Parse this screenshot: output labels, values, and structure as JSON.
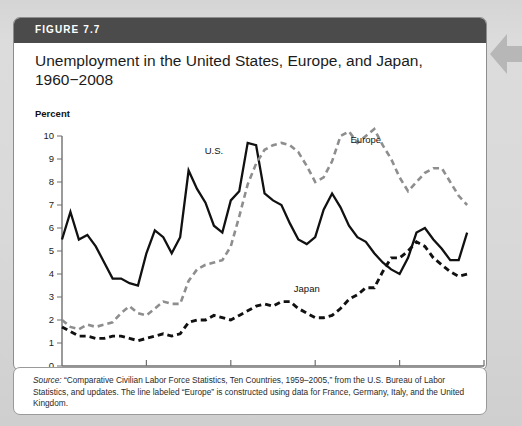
{
  "figure": {
    "number_label": "FIGURE 7.7",
    "title_line1": "Unemployment in the United States, Europe, and Japan,",
    "title_line2": "1960−2008",
    "percent_label": "Percent",
    "source_prefix": "Source:",
    "source_body": " “Comparative Civilian Labor Force Statistics, Ten Countries, 1959–2005,” from the U.S. Bureau of Labor Statistics, and updates. The line labeled “Europe” is constructed using data for France, Germany, Italy, and the United Kingdom."
  },
  "colors": {
    "header_bar": "#4b4b4b",
    "card_background": "#ffffff",
    "page_background": "#d8d8d8",
    "us_line": "#111111",
    "japan_line": "#111111",
    "europe_line": "#8e8e8e",
    "axis": "#6f6f6f",
    "edge_arrow": "#b4b4b4"
  },
  "chart_data": {
    "type": "line",
    "title": "Unemployment in the United States, Europe, and Japan, 1960−2008",
    "xlabel": "Year",
    "ylabel": "Percent",
    "xlim": [
      1960,
      2010
    ],
    "ylim": [
      0,
      10
    ],
    "grid": false,
    "legend_position": "inline-annotations",
    "x_ticks": [
      "1960",
      "1970",
      "1980",
      "1990",
      "2000",
      "2010"
    ],
    "x_tick_values": [
      1960,
      1970,
      1980,
      1990,
      2000,
      2010
    ],
    "y_ticks": [
      "0",
      "1",
      "2",
      "3",
      "4",
      "5",
      "6",
      "7",
      "8",
      "9",
      "10"
    ],
    "y_tick_values": [
      0,
      1,
      2,
      3,
      4,
      5,
      6,
      7,
      8,
      9,
      10
    ],
    "x": [
      1960,
      1961,
      1962,
      1963,
      1964,
      1965,
      1966,
      1967,
      1968,
      1969,
      1970,
      1971,
      1972,
      1973,
      1974,
      1975,
      1976,
      1977,
      1978,
      1979,
      1980,
      1981,
      1982,
      1983,
      1984,
      1985,
      1986,
      1987,
      1988,
      1989,
      1990,
      1991,
      1992,
      1993,
      1994,
      1995,
      1996,
      1997,
      1998,
      1999,
      2000,
      2001,
      2002,
      2003,
      2004,
      2005,
      2006,
      2007,
      2008
    ],
    "series": [
      {
        "name": "U.S.",
        "style": "solid",
        "color": "#111111",
        "label_x": 1978,
        "label_y": 9.2,
        "values": [
          5.5,
          6.7,
          5.5,
          5.7,
          5.2,
          4.5,
          3.8,
          3.8,
          3.6,
          3.5,
          4.9,
          5.9,
          5.6,
          4.9,
          5.6,
          8.5,
          7.7,
          7.1,
          6.1,
          5.8,
          7.2,
          7.6,
          9.7,
          9.6,
          7.5,
          7.2,
          7.0,
          6.2,
          5.5,
          5.3,
          5.6,
          6.8,
          7.5,
          6.9,
          6.1,
          5.6,
          5.4,
          4.9,
          4.5,
          4.2,
          4.0,
          4.7,
          5.8,
          6.0,
          5.5,
          5.1,
          4.6,
          4.6,
          5.8
        ]
      },
      {
        "name": "Europe",
        "style": "dashed",
        "color": "#8e8e8e",
        "label_x": 1996,
        "label_y": 9.7,
        "values": [
          2.0,
          1.7,
          1.6,
          1.8,
          1.7,
          1.8,
          1.9,
          2.3,
          2.6,
          2.3,
          2.2,
          2.5,
          2.8,
          2.7,
          2.7,
          3.7,
          4.2,
          4.4,
          4.5,
          4.6,
          5.2,
          6.5,
          7.9,
          8.8,
          9.4,
          9.6,
          9.7,
          9.6,
          9.3,
          8.7,
          8.0,
          8.2,
          8.9,
          10.0,
          10.2,
          9.7,
          10.0,
          10.3,
          9.6,
          9.0,
          8.2,
          7.6,
          8.0,
          8.4,
          8.6,
          8.6,
          8.0,
          7.4,
          7.0
        ]
      },
      {
        "name": "Japan",
        "style": "dashed-heavy",
        "color": "#111111",
        "label_x": 1989,
        "label_y": 3.2,
        "values": [
          1.7,
          1.5,
          1.3,
          1.3,
          1.2,
          1.2,
          1.3,
          1.3,
          1.2,
          1.1,
          1.2,
          1.3,
          1.4,
          1.3,
          1.4,
          1.9,
          2.0,
          2.0,
          2.2,
          2.1,
          2.0,
          2.2,
          2.4,
          2.6,
          2.7,
          2.6,
          2.8,
          2.8,
          2.5,
          2.3,
          2.1,
          2.1,
          2.2,
          2.5,
          2.9,
          3.1,
          3.4,
          3.4,
          4.1,
          4.7,
          4.7,
          5.0,
          5.4,
          5.2,
          4.7,
          4.4,
          4.1,
          3.9,
          4.0
        ]
      }
    ]
  }
}
